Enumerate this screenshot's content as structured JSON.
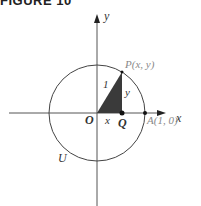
{
  "figure": {
    "title": "FIGURE 10",
    "labels": {
      "x_axis": "x",
      "y_axis": "y",
      "origin": "O",
      "point_p": "P(x, y)",
      "point_q": "Q",
      "point_a": "A(1, 0)",
      "circle": "U",
      "hypotenuse": "1",
      "leg_x": "x",
      "leg_y": "y"
    },
    "colors": {
      "axis": "#555555",
      "circle": "#444444",
      "triangle_fill": "#3a3a3a"
    }
  }
}
